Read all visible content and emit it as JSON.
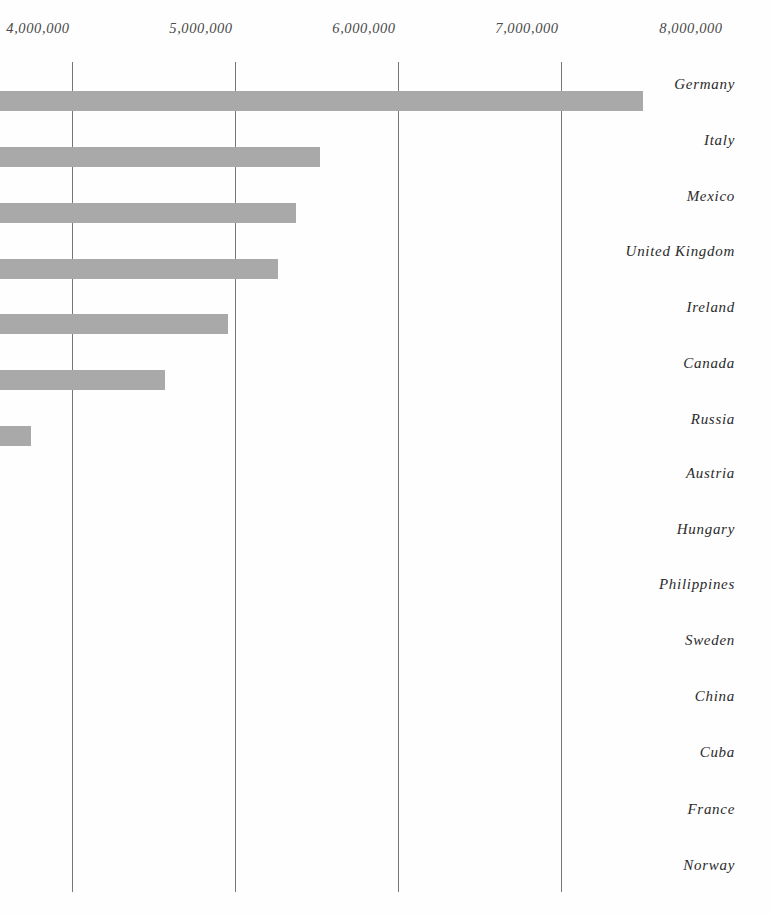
{
  "chart_data": {
    "type": "bar",
    "orientation": "horizontal",
    "title": "",
    "subtitle": "",
    "xlabel": "",
    "ylabel": "",
    "grid": true,
    "legend": null,
    "xlim": [
      4000000,
      8000000
    ],
    "x_axis_position": "top",
    "xticks": [
      {
        "label": "4,000,000",
        "value": 4000000,
        "px": 38,
        "clipped_left": true
      },
      {
        "label": "5,000,000",
        "value": 5000000,
        "px": 201
      },
      {
        "label": "6,000,000",
        "value": 6000000,
        "px": 364
      },
      {
        "label": "7,000,000",
        "value": 7000000,
        "px": 527
      },
      {
        "label": "8,000,000",
        "value": 8000000,
        "px": 691
      }
    ],
    "gridlines_px": [
      72,
      235,
      398,
      561
    ],
    "bar_color": "#a9a9a9",
    "gridline_color": "#5d5d63",
    "note": "bars are clipped by the left edge of the image; only the right-hand portion is visible",
    "categories": [
      "Germany",
      "Italy",
      "Mexico",
      "United Kingdom",
      "Ireland",
      "Canada",
      "Russia",
      "Austria",
      "Hungary",
      "Philippines",
      "Sweden",
      "China",
      "Cuba",
      "France",
      "Norway"
    ],
    "values": [
      8500000,
      6520000,
      6370000,
      6260000,
      5960000,
      5570000,
      4750000,
      null,
      null,
      null,
      null,
      null,
      null,
      null,
      null
    ],
    "bars_px": [
      {
        "category": "Germany",
        "end_px": 643,
        "y_px": 91,
        "visible": true
      },
      {
        "category": "Italy",
        "end_px": 320,
        "y_px": 147,
        "visible": true
      },
      {
        "category": "Mexico",
        "end_px": 296,
        "y_px": 203,
        "visible": true
      },
      {
        "category": "United Kingdom",
        "end_px": 278,
        "y_px": 259,
        "visible": true
      },
      {
        "category": "Ireland",
        "end_px": 228,
        "y_px": 314,
        "visible": true
      },
      {
        "category": "Canada",
        "end_px": 165,
        "y_px": 370,
        "visible": true
      },
      {
        "category": "Russia",
        "end_px": 31,
        "y_px": 426,
        "visible": true
      },
      {
        "category": "Austria",
        "end_px": 0,
        "y_px": 482,
        "visible": false
      },
      {
        "category": "Hungary",
        "end_px": 0,
        "y_px": 538,
        "visible": false
      },
      {
        "category": "Philippines",
        "end_px": 0,
        "y_px": 593,
        "visible": false
      },
      {
        "category": "Sweden",
        "end_px": 0,
        "y_px": 649,
        "visible": false
      },
      {
        "category": "China",
        "end_px": 0,
        "y_px": 705,
        "visible": false
      },
      {
        "category": "Cuba",
        "end_px": 0,
        "y_px": 760,
        "visible": false
      },
      {
        "category": "France",
        "end_px": 0,
        "y_px": 816,
        "visible": false
      },
      {
        "category": "Norway",
        "end_px": 0,
        "y_px": 872,
        "visible": false
      }
    ],
    "category_label_y_px": [
      84,
      140,
      196,
      251,
      307,
      363,
      419,
      473,
      529,
      584,
      640,
      696,
      752,
      809,
      865
    ]
  }
}
